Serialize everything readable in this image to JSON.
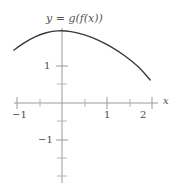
{
  "figure": {
    "title": "y = g(f(x))",
    "axis_x_label": "x",
    "colors": {
      "curve": "#3a3a3a",
      "axis": "#9a9a9a",
      "text": "#4a4a4a"
    }
  },
  "ticks": {
    "x_minus_1": "−1",
    "x_1": "1",
    "x_2": "2",
    "y_1": "1",
    "y_minus_1": "−1"
  },
  "chart_data": {
    "type": "line",
    "title": "y = g(f(x))",
    "xlabel": "x",
    "ylabel": "",
    "xlim": [
      -1.2,
      2.1
    ],
    "ylim": [
      -2.2,
      2.1
    ],
    "grid": false,
    "legend": null,
    "x_ticks": [
      -1,
      1,
      2
    ],
    "x_tick_labels": [
      "−1",
      "1",
      "2"
    ],
    "x_minor_ticks": [
      -0.5,
      0.5,
      1.5
    ],
    "y_ticks": [
      1,
      -1
    ],
    "y_tick_labels": [
      "1",
      "−1"
    ],
    "y_minor_ticks": [
      0.5,
      -0.5,
      -1.5,
      -2
    ],
    "series": [
      {
        "name": "y = g(f(x))",
        "color": "#3a3a3a",
        "x": [
          -1.07,
          -0.85,
          -0.6,
          -0.35,
          -0.09,
          0.2,
          0.5,
          0.8,
          1.1,
          1.4,
          1.7,
          1.96
        ],
        "y": [
          1.43,
          1.62,
          1.79,
          1.9,
          1.95,
          1.93,
          1.84,
          1.7,
          1.51,
          1.27,
          0.97,
          0.62
        ]
      }
    ]
  }
}
